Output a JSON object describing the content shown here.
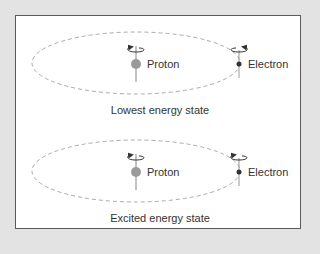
{
  "diagram": {
    "panels": [
      {
        "caption": "Lowest energy state",
        "proton_label": "Proton",
        "electron_label": "Electron",
        "proton_spin": "left",
        "electron_spin": "right"
      },
      {
        "caption": "Excited energy state",
        "proton_label": "Proton",
        "electron_label": "Electron",
        "proton_spin": "left",
        "electron_spin": "left"
      }
    ],
    "colors": {
      "background": "#e3e3e3",
      "frame_border": "#5a5a5a",
      "orbit": "#aaaaaa",
      "proton": "#9a9a9a",
      "electron": "#333333"
    }
  }
}
